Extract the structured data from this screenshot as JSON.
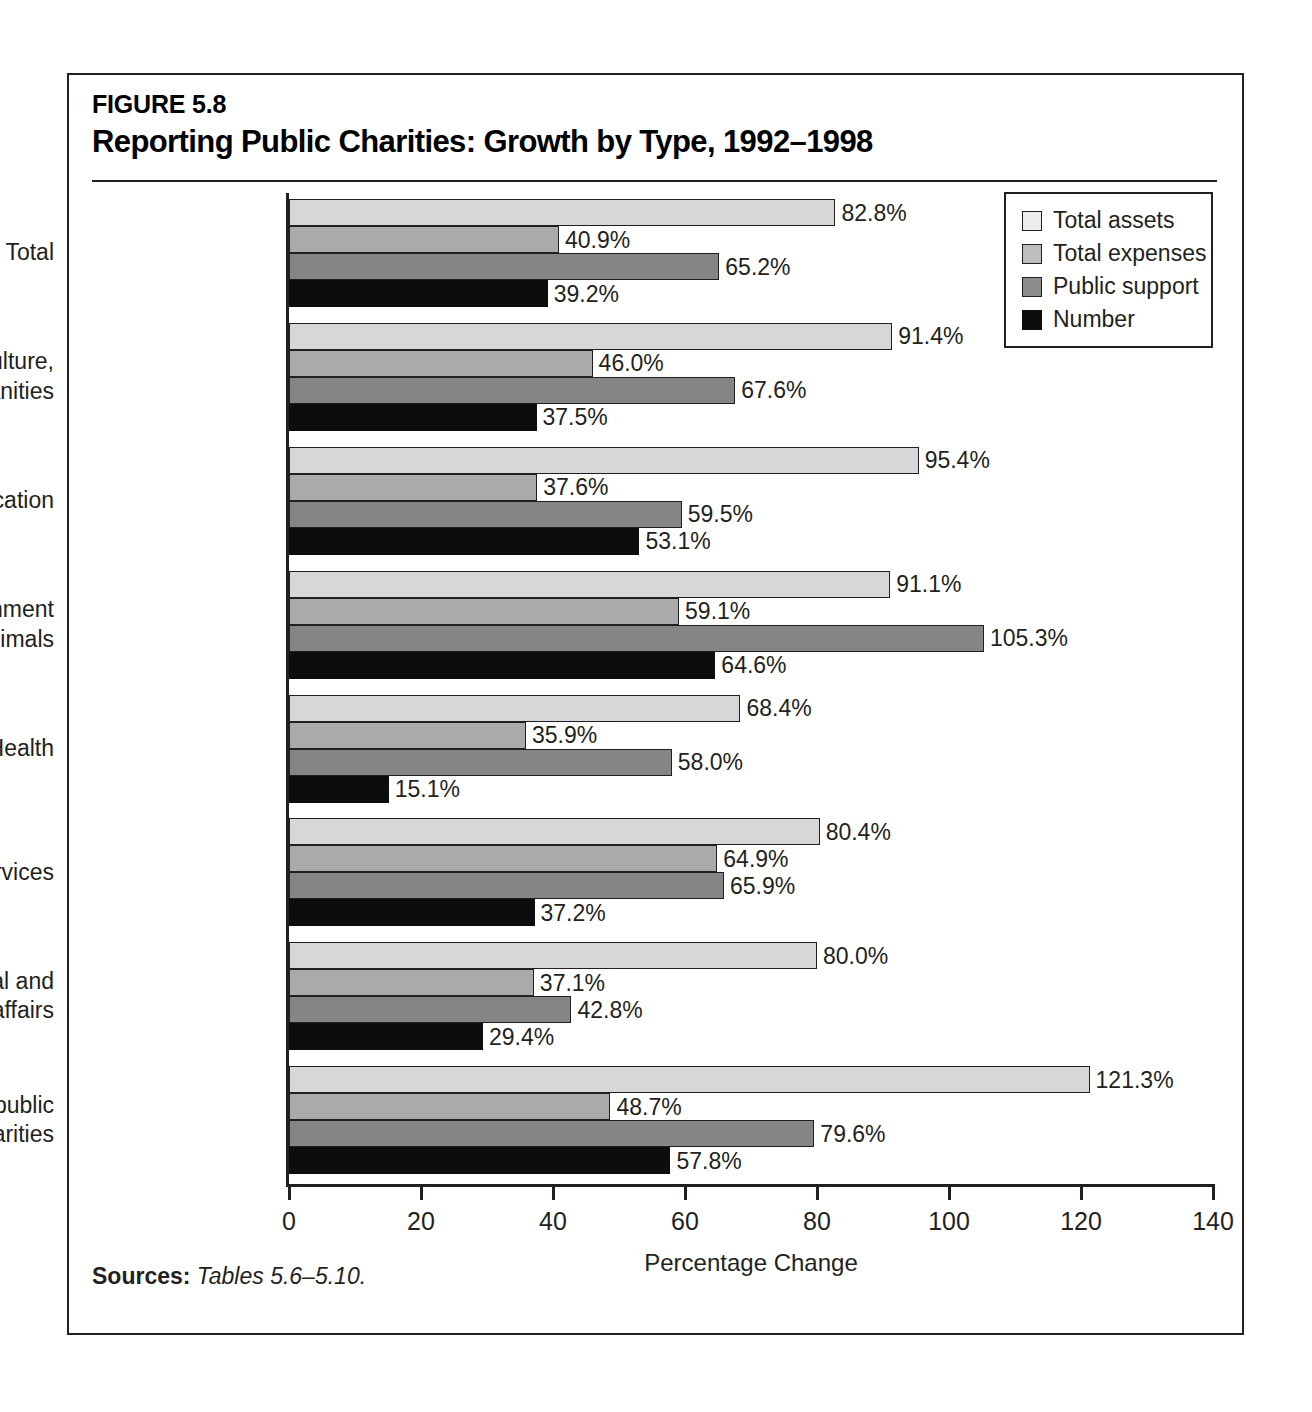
{
  "figure": {
    "number": "FIGURE 5.8",
    "title": "Reporting Public Charities: Growth by Type, 1992–1998",
    "sources_label": "Sources:",
    "sources_text": "Tables 5.6–5.10."
  },
  "legend": {
    "items": [
      {
        "label": "Total assets",
        "color": "#ececec"
      },
      {
        "label": "Total expenses",
        "color": "#bdbdbd"
      },
      {
        "label": "Public support",
        "color": "#8c8c8c"
      },
      {
        "label": "Number",
        "color": "#0d0d0d"
      }
    ]
  },
  "axis": {
    "x_title": "Percentage Change",
    "x_ticks": [
      "0",
      "20",
      "40",
      "60",
      "80",
      "100",
      "120",
      "140"
    ]
  },
  "chart_data": {
    "type": "bar",
    "orientation": "horizontal",
    "title": "Reporting Public Charities: Growth by Type, 1992–1998",
    "xlabel": "Percentage Change",
    "ylabel": "",
    "xlim": [
      0,
      140
    ],
    "xticks": [
      0,
      20,
      40,
      60,
      80,
      100,
      120,
      140
    ],
    "grid": false,
    "legend_position": "top-right",
    "value_suffix": "%",
    "categories": [
      "Total",
      "Arts, culture, and humanities",
      "Education",
      "Environment and animals",
      "Health",
      "Human services",
      "International and foreign affairs",
      "Other public charities"
    ],
    "category_lines": [
      [
        "Total"
      ],
      [
        "Arts, culture,",
        "and humanities"
      ],
      [
        "Education"
      ],
      [
        "Environment",
        "and animals"
      ],
      [
        "Health"
      ],
      [
        "Human services"
      ],
      [
        "International and",
        "foreign affairs"
      ],
      [
        "Other public",
        "charities"
      ]
    ],
    "series": [
      {
        "name": "Total assets",
        "color": "#d7d7d7",
        "values": [
          82.8,
          91.4,
          95.4,
          91.1,
          68.4,
          80.4,
          80.0,
          121.3
        ],
        "labels": [
          "82.8%",
          "91.4%",
          "95.4%",
          "91.1%",
          "68.4%",
          "80.4%",
          "80.0%",
          "121.3%"
        ]
      },
      {
        "name": "Total expenses",
        "color": "#aaaaaa",
        "values": [
          40.9,
          46.0,
          37.6,
          59.1,
          35.9,
          64.9,
          37.1,
          48.7
        ],
        "labels": [
          "40.9%",
          "46.0%",
          "37.6%",
          "59.1%",
          "35.9%",
          "64.9%",
          "37.1%",
          "48.7%"
        ]
      },
      {
        "name": "Public support",
        "color": "#858585",
        "values": [
          65.2,
          67.6,
          59.5,
          105.3,
          58.0,
          65.9,
          42.8,
          79.6
        ],
        "labels": [
          "65.2%",
          "67.6%",
          "59.5%",
          "105.3%",
          "58.0%",
          "65.9%",
          "42.8%",
          "79.6%"
        ]
      },
      {
        "name": "Number",
        "color": "#0d0d0d",
        "values": [
          39.2,
          37.5,
          53.1,
          64.6,
          15.1,
          37.2,
          29.4,
          57.8
        ],
        "labels": [
          "39.2%",
          "37.5%",
          "53.1%",
          "64.6%",
          "15.1%",
          "37.2%",
          "29.4%",
          "57.8%"
        ]
      }
    ]
  }
}
